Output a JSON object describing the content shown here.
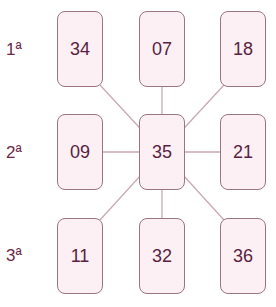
{
  "colors": {
    "box_fill": "#fcf0f4",
    "box_border": "#9a7585",
    "line": "#c9a9b7",
    "text": "#5a2240"
  },
  "rows": [
    {
      "label": "1ª",
      "cells": [
        "34",
        "07",
        "18"
      ]
    },
    {
      "label": "2ª",
      "cells": [
        "09",
        "35",
        "21"
      ]
    },
    {
      "label": "3ª",
      "cells": [
        "11",
        "32",
        "36"
      ]
    }
  ],
  "center": "35"
}
